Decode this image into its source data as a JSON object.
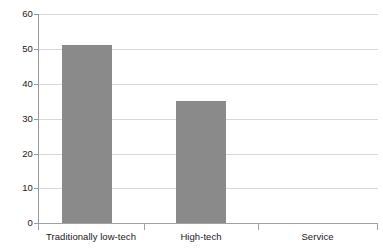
{
  "chart_data": {
    "type": "bar",
    "title": "",
    "subtitle": "",
    "xlabel": "",
    "ylabel": "",
    "categories": [
      "Traditionally low-tech",
      "High-tech",
      "Service"
    ],
    "values": [
      51,
      35,
      0
    ],
    "series": [
      {
        "name": "",
        "values": [
          51,
          35,
          0
        ],
        "color": "#8a8a8a"
      }
    ],
    "ylim": [
      0,
      60
    ],
    "yticks": [
      0,
      10,
      20,
      30,
      40,
      50,
      60
    ],
    "ytick_labels": [
      "0",
      "10",
      "20",
      "30",
      "40",
      "50",
      "60"
    ],
    "grid": true,
    "grid_axis": "y",
    "legend": false,
    "legend_position": "none",
    "annotations": [],
    "colors": {
      "bar_fill": "#8a8a8a",
      "gridline": "#d9d9d9",
      "axis_line": "#9a9a9a",
      "baseline": "#a2a2a2",
      "text": "#1a1a1a",
      "background": "#ffffff"
    }
  }
}
